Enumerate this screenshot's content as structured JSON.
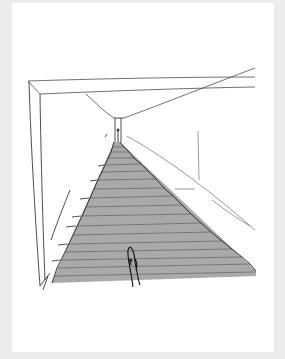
{
  "image": {
    "alt": "Hand-drawn perspective sketch of a long corridor with a grey ramped staircase receding to a narrow doorway, a small figure at the end and a figure in the foreground",
    "colors": {
      "background": "#ececec",
      "card": "#ffffff",
      "ink": "#222222",
      "floor_fill": "#a9a9a9",
      "stair_lines": "#6a6a6a"
    }
  }
}
